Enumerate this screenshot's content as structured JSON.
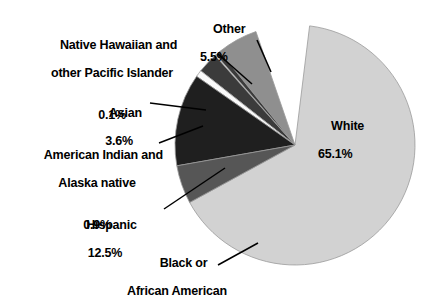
{
  "chart_data": {
    "type": "pie",
    "title": "",
    "subtitle": "",
    "xlabel": "",
    "ylabel": "",
    "legend_position": "none",
    "grid": false,
    "units": "percent",
    "categories": [
      "White",
      "Other",
      "Native Hawaiian and other Pacific Islander",
      "Asian",
      "American Indian and Alaska native",
      "Hispanic",
      "Black or African American"
    ],
    "values": [
      65.1,
      5.5,
      0.1,
      3.6,
      0.9,
      12.5,
      12.3
    ],
    "slices": [
      {
        "name": "White",
        "label_line1": "White",
        "label_line2": "65.1%",
        "value": 65.1,
        "value_text": "65.1%",
        "color": "#d2d2d2",
        "start_deg": 7,
        "end_deg": 241.4
      },
      {
        "name": "Other",
        "label_line1": "Other",
        "label_line2": "5.5%",
        "value": 5.5,
        "value_text": "5.5%",
        "color": "#8f8f8f",
        "start_deg": 321.2,
        "end_deg": 341.0
      },
      {
        "name": "Native Hawaiian and other Pacific Islander",
        "label_line1": "Native Hawaiian and",
        "label_line2": "other Pacific Islander",
        "label_line3": "0.1%",
        "value": 0.1,
        "value_text": "0.1%",
        "color": "#f2f2f2",
        "start_deg": 318.2,
        "end_deg": 318.6
      },
      {
        "name": "Asian",
        "label_line1": "Asian",
        "label_line2": "3.6%",
        "value": 3.6,
        "value_text": "3.6%",
        "color": "#3b3b3b",
        "start_deg": 308.2,
        "end_deg": 321.2
      },
      {
        "name": "American Indian and Alaska native",
        "label_line1": "American Indian and",
        "label_line2": "Alaska native",
        "label_line3": "0.9%",
        "value": 0.9,
        "value_text": "0.9%",
        "color": "#fafafa",
        "start_deg": 304.9,
        "end_deg": 308.2
      },
      {
        "name": "Hispanic",
        "label_line1": "Hispanic",
        "label_line2": "12.5%",
        "value": 12.5,
        "value_text": "12.5%",
        "color": "#1f1f1f",
        "start_deg": 260.0,
        "end_deg": 304.9
      },
      {
        "name": "Black or African American",
        "label_line1": "Black or",
        "label_line2": "African American",
        "label_line3": "",
        "value": 12.3,
        "value_text": "",
        "color": "#565656",
        "start_deg": 241.4,
        "end_deg": 260.0
      }
    ],
    "geometry": {
      "cx": 295,
      "cy": 145,
      "r": 120
    },
    "colors": {
      "background": "#ffffff",
      "text": "#000000",
      "leader_line": "#000000",
      "slice_outline": "#9a9a9a"
    }
  }
}
